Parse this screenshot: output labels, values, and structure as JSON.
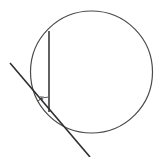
{
  "figure": {
    "kind": "circle-tangent-chord-angle-diagram",
    "background_color": "#ffffff",
    "labels": {
      "angle": "x"
    },
    "colors": {
      "circle_stroke": "#4a4a4a",
      "chord_stroke": "#3a3a3a",
      "tangent_stroke": "#2e2e2e",
      "arc_stroke": "#5a5a5a",
      "label_color": "#2b2b2b"
    },
    "geometry": {
      "canvas": {
        "width": 160,
        "height": 157
      },
      "circle": {
        "cx": 91.5,
        "cy": 72,
        "r": 61
      },
      "chord": {
        "x1": 49,
        "y1": 31,
        "x2": 49,
        "y2": 112
      },
      "tangent": {
        "x1": 10,
        "y1": 63,
        "x2": 90,
        "y2": 157
      },
      "tangent_point": {
        "x": 49,
        "y": 112
      },
      "angle_arc": {
        "vertex_x": 49,
        "vertex_y": 112,
        "path": "M 38.0 100.9 A 15 15 0 0 1 49 97"
      },
      "angle_label_position": {
        "x": 41.5,
        "y": 97.5
      }
    }
  }
}
